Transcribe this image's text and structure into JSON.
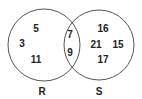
{
  "diagram": {
    "type": "venn",
    "stroke_color": "#555555",
    "text_color": "#222222",
    "sets": [
      {
        "name": "R",
        "label": "R",
        "cx": 44,
        "cy": 45,
        "r": 36,
        "label_x": 42,
        "label_y": 95
      },
      {
        "name": "S",
        "label": "S",
        "cx": 99,
        "cy": 45,
        "r": 35,
        "label_x": 99,
        "label_y": 95
      }
    ],
    "regions": {
      "r_only": [
        {
          "value": "5",
          "x": 36,
          "y": 32
        },
        {
          "value": "3",
          "x": 22,
          "y": 47
        },
        {
          "value": "11",
          "x": 36,
          "y": 63
        }
      ],
      "intersection": [
        {
          "value": "7",
          "x": 70,
          "y": 38
        },
        {
          "value": "9",
          "x": 70,
          "y": 56
        }
      ],
      "s_only": [
        {
          "value": "16",
          "x": 103,
          "y": 32
        },
        {
          "value": "21",
          "x": 96,
          "y": 48
        },
        {
          "value": "15",
          "x": 118,
          "y": 48
        },
        {
          "value": "17",
          "x": 103,
          "y": 63
        }
      ]
    }
  }
}
